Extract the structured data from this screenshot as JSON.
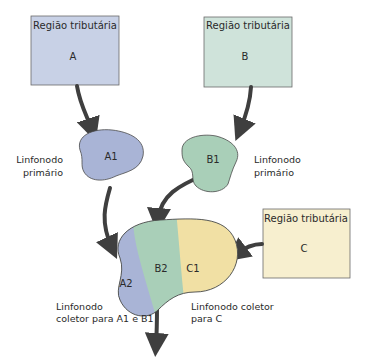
{
  "diagram": {
    "regions": [
      {
        "id": "A",
        "title": "Região tributária",
        "letter": "A",
        "color": "#c8d1e6"
      },
      {
        "id": "B",
        "title": "Região tributária",
        "letter": "B",
        "color": "#cfe3da"
      },
      {
        "id": "C",
        "title": "Região tributária",
        "letter": "C",
        "color": "#f7efcf"
      }
    ],
    "nodes": {
      "A1": {
        "label": "A1",
        "caption_lines": [
          "Linfonodo",
          "primário"
        ],
        "color": "#a9b4d6"
      },
      "B1": {
        "label": "B1",
        "caption_lines": [
          "Linfonodo",
          "primário"
        ],
        "color": "#a9cfb8"
      },
      "collector": {
        "segments": [
          {
            "label": "A2",
            "color": "#a9b4d6"
          },
          {
            "label": "B2",
            "color": "#a9cfb8"
          },
          {
            "label": "C1",
            "color": "#f1e0a4"
          }
        ],
        "caption_left": [
          "Linfonodo",
          "coletor para A1 e B1"
        ],
        "caption_right": [
          "Linfonodo coletor",
          "para C"
        ]
      }
    },
    "colors": {
      "arrow": "#3f3f3f",
      "outline": "#4a4a4a"
    }
  }
}
